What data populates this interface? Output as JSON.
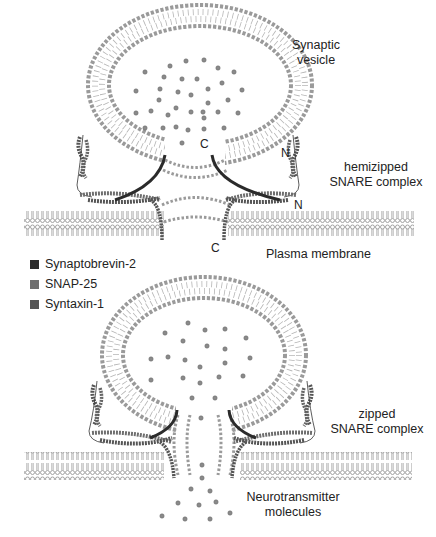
{
  "labels": {
    "synaptic_vesicle": [
      "Synaptic",
      "vesicle"
    ],
    "hemizipped": [
      "hemizipped",
      "SNARE complex"
    ],
    "plasma_membrane": "Plasma membrane",
    "zipped": [
      "zipped",
      "SNARE complex"
    ],
    "neurotransmitter": [
      "Neurotransmitter",
      "molecules"
    ]
  },
  "terminals": {
    "c_top_vesicle": "C",
    "n_top_right": "N",
    "n_right_membrane": "N",
    "c_bottom_membrane": "C"
  },
  "legend": [
    {
      "label": "Synaptobrevin-2",
      "color": "#2b2b2b"
    },
    {
      "label": "SNAP-25",
      "color": "#6e6e6e"
    },
    {
      "label": "Syntaxin-1",
      "color": "#555555"
    }
  ],
  "colors": {
    "lipid": "#9a9a9a",
    "molecule": "#8a8a8a",
    "synaptobrevin": "#2b2b2b",
    "snap25": "#6e6e6e",
    "syntaxin": "#555555"
  },
  "panels": [
    {
      "name": "hemizipped-state",
      "description": "Synaptic vesicle docked with hemizipped SNARE complex above plasma membrane"
    },
    {
      "name": "zipped-state",
      "description": "Fusion pore opened with zipped SNARE complex releasing neurotransmitter molecules"
    }
  ]
}
